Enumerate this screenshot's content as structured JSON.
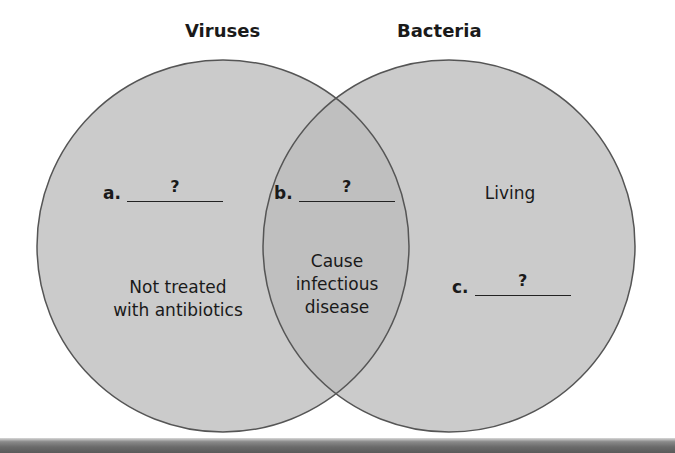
{
  "diagram": {
    "type": "venn",
    "sets": [
      {
        "name": "Viruses",
        "unique": {
          "blank": {
            "letter": "a.",
            "answer": "?"
          },
          "statement": "Not treated with antibiotics"
        }
      },
      {
        "name": "Bacteria",
        "unique": {
          "statement": "Living",
          "blank": {
            "letter": "c.",
            "answer": "?"
          }
        }
      }
    ],
    "intersection": {
      "blank": {
        "letter": "b.",
        "answer": "?"
      },
      "statement_lines": [
        "Cause",
        "infectious",
        "disease"
      ]
    },
    "left_statement_lines": [
      "Not treated",
      "with antibiotics"
    ],
    "colors": {
      "fill": "#cbcbcb",
      "overlap": "#bfbfbf",
      "stroke": "#555555",
      "text": "#1a1a1a"
    }
  }
}
